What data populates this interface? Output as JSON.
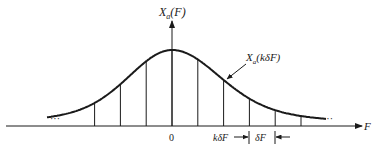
{
  "diagram": {
    "y_axis_label_main": "X",
    "y_axis_label_sub": "a",
    "y_axis_label_arg": "(F)",
    "curve_label_main": "X",
    "curve_label_sub": "a",
    "curve_label_arg": "(kδF)",
    "x_axis_label": "F",
    "origin_label": "0",
    "sample_label": "kδF",
    "spacing_label": "δF",
    "left_ellipsis": "···",
    "right_ellipsis": "···",
    "sample_indices": [
      -3,
      -2,
      -1,
      0,
      1,
      2,
      3,
      4,
      5
    ],
    "curve_shape": "bell",
    "colors": {
      "ink": "#1a1a1a",
      "background": "#ffffff"
    }
  }
}
